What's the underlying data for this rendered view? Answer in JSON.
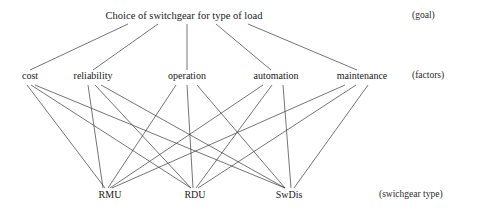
{
  "diagram": {
    "title": "Choice of switchgear for type of load",
    "levels": [
      {
        "key": "goal",
        "annotation": "(goal)"
      },
      {
        "key": "factors",
        "annotation": "(factors)"
      },
      {
        "key": "alternatives",
        "annotation": "(swichgear type)"
      }
    ],
    "goal": {
      "label": "Choice of switchgear for type of load",
      "x": 184,
      "y": 20
    },
    "factors": [
      {
        "id": "cost",
        "label": "cost",
        "x": 30,
        "y": 80
      },
      {
        "id": "reliability",
        "label": "reliability",
        "x": 93,
        "y": 80
      },
      {
        "id": "operation",
        "label": "operation",
        "x": 187,
        "y": 80
      },
      {
        "id": "automation",
        "label": "automation",
        "x": 276,
        "y": 80
      },
      {
        "id": "maintenance",
        "label": "maintenance",
        "x": 362,
        "y": 80
      }
    ],
    "alternatives": [
      {
        "id": "rmu",
        "label": "RMU",
        "x": 110,
        "y": 199
      },
      {
        "id": "rdu",
        "label": "RDU",
        "x": 195,
        "y": 199
      },
      {
        "id": "swdis",
        "label": "SwDis",
        "x": 289,
        "y": 199
      }
    ],
    "annotations": [
      {
        "id": "goal-annotation",
        "text": "(goal)",
        "x": 412,
        "y": 20
      },
      {
        "id": "factors-annotation",
        "text": "(factors)",
        "x": 412,
        "y": 80
      },
      {
        "id": "alternatives-annotation",
        "text": "(swichgear type)",
        "x": 379,
        "y": 199
      }
    ],
    "style": {
      "line_color": "#3a3a3a",
      "line_width": 0.7,
      "background": "#ffffff",
      "text_color": "#1a1a1a"
    },
    "edges_goal_to_factors": [
      {
        "from": "goal",
        "to": "cost",
        "x1": 128,
        "y1": 24,
        "x2": 30,
        "y2": 70
      },
      {
        "from": "goal",
        "to": "reliability",
        "x1": 158,
        "y1": 24,
        "x2": 93,
        "y2": 70
      },
      {
        "from": "goal",
        "to": "operation",
        "x1": 187,
        "y1": 24,
        "x2": 187,
        "y2": 70
      },
      {
        "from": "goal",
        "to": "automation",
        "x1": 216,
        "y1": 24,
        "x2": 271,
        "y2": 70
      },
      {
        "from": "goal",
        "to": "maintenance",
        "x1": 248,
        "y1": 24,
        "x2": 357,
        "y2": 70
      }
    ],
    "edges_factors_to_alternatives": [
      {
        "from": "cost",
        "to": "rmu",
        "x1": 27,
        "y1": 85,
        "x2": 105,
        "y2": 188
      },
      {
        "from": "cost",
        "to": "rdu",
        "x1": 31,
        "y1": 85,
        "x2": 191,
        "y2": 188
      },
      {
        "from": "cost",
        "to": "swdis",
        "x1": 35,
        "y1": 85,
        "x2": 285,
        "y2": 188
      },
      {
        "from": "reliability",
        "to": "rmu",
        "x1": 88,
        "y1": 85,
        "x2": 103,
        "y2": 188
      },
      {
        "from": "reliability",
        "to": "rdu",
        "x1": 95,
        "y1": 85,
        "x2": 191,
        "y2": 188
      },
      {
        "from": "reliability",
        "to": "swdis",
        "x1": 101,
        "y1": 85,
        "x2": 285,
        "y2": 188
      },
      {
        "from": "operation",
        "to": "rmu",
        "x1": 176,
        "y1": 85,
        "x2": 108,
        "y2": 188
      },
      {
        "from": "operation",
        "to": "rdu",
        "x1": 187,
        "y1": 85,
        "x2": 193,
        "y2": 188
      },
      {
        "from": "operation",
        "to": "swdis",
        "x1": 197,
        "y1": 85,
        "x2": 285,
        "y2": 188
      },
      {
        "from": "automation",
        "to": "rmu",
        "x1": 263,
        "y1": 85,
        "x2": 110,
        "y2": 188
      },
      {
        "from": "automation",
        "to": "rdu",
        "x1": 272,
        "y1": 85,
        "x2": 196,
        "y2": 188
      },
      {
        "from": "automation",
        "to": "swdis",
        "x1": 283,
        "y1": 85,
        "x2": 291,
        "y2": 188
      },
      {
        "from": "maintenance",
        "to": "rmu",
        "x1": 345,
        "y1": 85,
        "x2": 112,
        "y2": 188
      },
      {
        "from": "maintenance",
        "to": "rdu",
        "x1": 356,
        "y1": 85,
        "x2": 198,
        "y2": 188
      },
      {
        "from": "maintenance",
        "to": "swdis",
        "x1": 368,
        "y1": 85,
        "x2": 294,
        "y2": 188
      }
    ]
  }
}
